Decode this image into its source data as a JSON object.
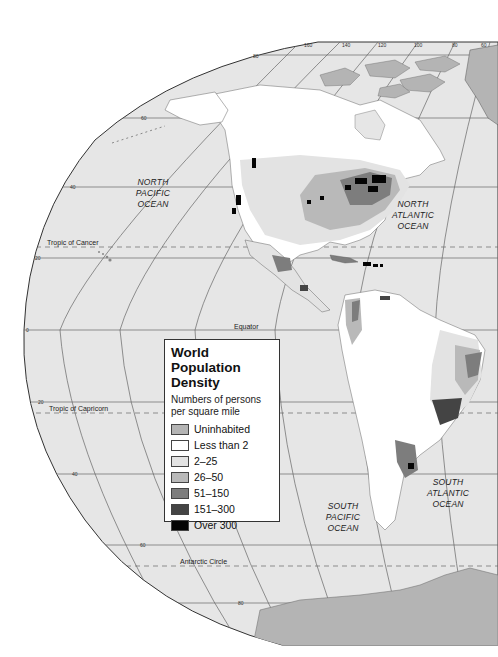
{
  "legend": {
    "title_line1": "World Population",
    "title_line2": "Density",
    "subtitle_line1": "Numbers of persons",
    "subtitle_line2": "per square mile",
    "items": [
      {
        "label": "Uninhabited",
        "color": "#b4b4b4"
      },
      {
        "label": "Less than 2",
        "color": "#ffffff"
      },
      {
        "label": "2–25",
        "color": "#e3e3e3"
      },
      {
        "label": "26–50",
        "color": "#b9b9b9"
      },
      {
        "label": "51–150",
        "color": "#7d7d7d"
      },
      {
        "label": "151–300",
        "color": "#444444"
      },
      {
        "label": "Over 300",
        "color": "#050505"
      }
    ]
  },
  "oceans": {
    "north_pacific": [
      "NORTH",
      "PACIFIC",
      "OCEAN"
    ],
    "north_atlantic": [
      "NORTH",
      "ATLANTIC",
      "OCEAN"
    ],
    "south_pacific": [
      "SOUTH",
      "PACIFIC",
      "OCEAN"
    ],
    "south_atlantic": [
      "SOUTH",
      "ATLANTIC",
      "OCEAN"
    ]
  },
  "reference_lines": {
    "tropic_of_cancer": "Tropic of Cancer",
    "equator": "Equator",
    "tropic_of_capricorn": "Tropic of Capricorn",
    "antarctic_circle": "Antarctic Circle"
  },
  "latitude_labels": {
    "n80": "80",
    "n60": "60",
    "n40": "40",
    "n20": "20",
    "eq": "0",
    "s20": "20",
    "s40": "40",
    "s60": "60",
    "s80": "80"
  },
  "longitude_labels": {
    "w160": "160",
    "w140": "140",
    "w120": "120",
    "w100": "100",
    "w80": "80",
    "w60": "60"
  },
  "colors": {
    "ocean": "#e6e6e6",
    "land_sparse": "#ffffff",
    "land_low": "#e3e3e3",
    "land_mid": "#b9b9b9",
    "land_high": "#7d7d7d",
    "land_vhigh": "#444444",
    "land_max": "#050505",
    "uninhabited": "#b4b4b4",
    "grid": "#555555"
  }
}
